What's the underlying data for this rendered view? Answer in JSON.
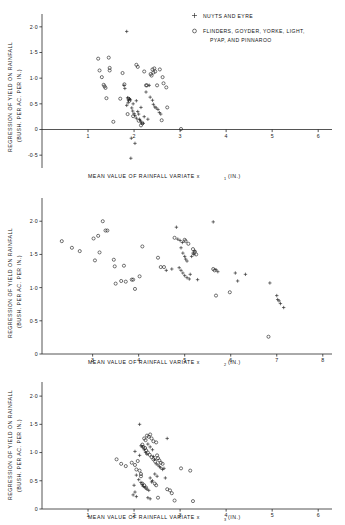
{
  "figure": {
    "title": "",
    "legend": {
      "position": "top-right",
      "entries": [
        {
          "marker": "plus",
          "label": "NUYTS AND EYRE"
        },
        {
          "marker": "circle",
          "label": "FLINDERS, GOYDER, YORKE, LIGHT,"
        },
        {
          "marker": "none",
          "label": "PYAP, AND PINNAROO"
        }
      ]
    },
    "shared_ylabel_line1": "REGRESSION OF YIELD ON RAINFALL",
    "shared_ylabel_line2": "(BUSH. PER AC. PER IN.)"
  },
  "chart_data": [
    {
      "type": "scatter",
      "title": "",
      "xlabel": "MEAN VALUE OF RAINFALL VARIATE x",
      "xlabel_sub": "1",
      "xlabel_unit": "(IN.)",
      "ylabel": "REGRESSION OF YIELD ON RAINFALL (BUSH. PER AC. PER IN.)",
      "xlim": [
        0,
        6.3
      ],
      "ylim": [
        -0.75,
        2.25
      ],
      "xticks": [
        1,
        2,
        3,
        4,
        5,
        6
      ],
      "xticklabels": [
        "1",
        "2",
        "3",
        "4",
        "5",
        "6"
      ],
      "yticks": [
        -0.5,
        0,
        0.5,
        1.0,
        1.5,
        2.0
      ],
      "yticklabels": [
        "-0·5",
        "0",
        "0·5",
        "1·0",
        "1·5",
        "2·0"
      ],
      "grid": false,
      "series": [
        {
          "name": "NUYTS AND EYRE",
          "marker": "plus",
          "points": [
            [
              1.84,
              1.91
            ],
            [
              1.78,
              0.86
            ],
            [
              1.8,
              0.8
            ],
            [
              1.86,
              0.62
            ],
            [
              1.88,
              0.57
            ],
            [
              1.9,
              0.6
            ],
            [
              1.92,
              0.58
            ],
            [
              1.87,
              0.52
            ],
            [
              1.84,
              0.47
            ],
            [
              1.95,
              0.42
            ],
            [
              1.97,
              0.36
            ],
            [
              2.0,
              0.31
            ],
            [
              2.02,
              0.27
            ],
            [
              2.05,
              0.22
            ],
            [
              2.08,
              0.35
            ],
            [
              2.1,
              0.3
            ],
            [
              2.12,
              0.2
            ],
            [
              2.14,
              0.17
            ],
            [
              2.16,
              0.13
            ],
            [
              2.2,
              0.12
            ],
            [
              2.22,
              0.25
            ],
            [
              2.26,
              0.73
            ],
            [
              2.35,
              0.63
            ],
            [
              2.4,
              0.57
            ],
            [
              2.42,
              0.49
            ],
            [
              2.45,
              0.44
            ],
            [
              2.48,
              0.42
            ],
            [
              2.52,
              0.39
            ],
            [
              2.55,
              0.33
            ],
            [
              2.58,
              0.3
            ],
            [
              1.94,
              -0.17
            ],
            [
              2.02,
              -0.27
            ],
            [
              1.93,
              -0.56
            ],
            [
              2.33,
              0.86
            ],
            [
              2.05,
              0.56
            ],
            [
              1.98,
              0.5
            ],
            [
              2.3,
              0.2
            ],
            [
              2.15,
              0.43
            ]
          ]
        },
        {
          "name": "FLINDERS, GOYDER, YORKE, LIGHT, PYAP, AND PINNAROO",
          "marker": "circle",
          "points": [
            [
              1.22,
              1.38
            ],
            [
              1.25,
              1.15
            ],
            [
              1.3,
              1.02
            ],
            [
              1.34,
              0.87
            ],
            [
              1.36,
              0.84
            ],
            [
              1.38,
              0.81
            ],
            [
              1.4,
              0.61
            ],
            [
              1.45,
              1.4
            ],
            [
              1.47,
              1.2
            ],
            [
              1.47,
              1.15
            ],
            [
              1.55,
              0.15
            ],
            [
              1.75,
              1.1
            ],
            [
              1.79,
              0.88
            ],
            [
              1.7,
              0.6
            ],
            [
              1.88,
              0.6
            ],
            [
              1.9,
              0.56
            ],
            [
              1.86,
              0.3
            ],
            [
              1.98,
              0.26
            ],
            [
              2.05,
              1.26
            ],
            [
              2.08,
              1.22
            ],
            [
              2.22,
              1.13
            ],
            [
              2.26,
              0.86
            ],
            [
              2.28,
              0.86
            ],
            [
              2.4,
              1.17
            ],
            [
              2.44,
              1.19
            ],
            [
              2.42,
              1.11
            ],
            [
              2.46,
              1.13
            ],
            [
              2.5,
              0.86
            ],
            [
              2.56,
              1.17
            ],
            [
              2.62,
              1.02
            ],
            [
              2.64,
              0.9
            ],
            [
              2.7,
              0.82
            ],
            [
              2.72,
              0.43
            ],
            [
              2.6,
              0.18
            ],
            [
              2.36,
              1.08
            ],
            [
              2.38,
              1.05
            ],
            [
              3.02,
              0.01
            ],
            [
              2.15,
              0.08
            ],
            [
              2.18,
              0.12
            ],
            [
              2.1,
              0.17
            ]
          ]
        }
      ]
    },
    {
      "type": "scatter",
      "title": "",
      "xlabel": "MEAN VALUE OF RAINFALL VARIATE x",
      "xlabel_sub": "2",
      "xlabel_unit": "(IN.)",
      "ylabel": "REGRESSION OF YIELD ON RAINFALL (BUSH. PER AC. PER IN.)",
      "xlim": [
        1.9,
        8.2
      ],
      "ylim": [
        0,
        2.35
      ],
      "xticks": [
        3,
        4,
        5,
        6,
        7,
        8
      ],
      "xticklabels": [
        "3",
        "4",
        "5",
        "6",
        "7",
        "8"
      ],
      "yticks": [
        0,
        0.5,
        1.0,
        1.5,
        2.0
      ],
      "yticklabels": [
        "0",
        "0·5",
        "1·0",
        "1·5",
        "2·0"
      ],
      "grid": false,
      "series": [
        {
          "name": "NUYTS AND EYRE",
          "marker": "plus",
          "points": [
            [
              4.85,
              1.73
            ],
            [
              4.9,
              1.71
            ],
            [
              4.95,
              1.68
            ],
            [
              4.92,
              1.6
            ],
            [
              4.96,
              1.52
            ],
            [
              5.0,
              1.47
            ],
            [
              5.02,
              1.43
            ],
            [
              5.05,
              1.4
            ],
            [
              4.88,
              1.3
            ],
            [
              4.92,
              1.26
            ],
            [
              4.96,
              1.22
            ],
            [
              5.0,
              1.18
            ],
            [
              5.05,
              1.15
            ],
            [
              5.1,
              1.13
            ],
            [
              5.15,
              1.47
            ],
            [
              5.18,
              1.52
            ],
            [
              5.2,
              1.5
            ],
            [
              5.22,
              1.55
            ],
            [
              5.28,
              1.12
            ],
            [
              4.82,
              1.91
            ],
            [
              5.62,
              1.99
            ],
            [
              5.68,
              1.27
            ],
            [
              5.72,
              1.24
            ],
            [
              6.1,
              1.22
            ],
            [
              6.15,
              1.1
            ],
            [
              6.32,
              1.2
            ],
            [
              6.85,
              1.07
            ],
            [
              7.0,
              0.88
            ],
            [
              7.02,
              0.82
            ],
            [
              7.05,
              0.8
            ],
            [
              7.08,
              0.76
            ],
            [
              7.15,
              0.7
            ],
            [
              4.6,
              1.26
            ],
            [
              4.72,
              1.28
            ],
            [
              5.12,
              1.2
            ]
          ]
        },
        {
          "name": "FLINDERS, GOYDER, YORKE, LIGHT, PYAP, AND PINNAROO",
          "marker": "circle",
          "points": [
            [
              2.33,
              1.7
            ],
            [
              2.55,
              1.6
            ],
            [
              2.72,
              1.55
            ],
            [
              3.02,
              1.74
            ],
            [
              3.05,
              1.41
            ],
            [
              3.12,
              1.78
            ],
            [
              3.15,
              1.53
            ],
            [
              3.22,
              2.0
            ],
            [
              3.28,
              1.86
            ],
            [
              3.46,
              1.42
            ],
            [
              3.48,
              1.32
            ],
            [
              3.5,
              1.06
            ],
            [
              3.62,
              1.1
            ],
            [
              3.68,
              1.33
            ],
            [
              3.72,
              1.09
            ],
            [
              3.85,
              1.12
            ],
            [
              3.88,
              1.12
            ],
            [
              3.92,
              0.98
            ],
            [
              4.02,
              1.17
            ],
            [
              4.08,
              1.62
            ],
            [
              4.42,
              1.45
            ],
            [
              4.55,
              1.31
            ],
            [
              4.78,
              1.75
            ],
            [
              5.0,
              1.72
            ],
            [
              5.02,
              1.7
            ],
            [
              5.18,
              1.58
            ],
            [
              5.22,
              1.54
            ],
            [
              5.25,
              1.5
            ],
            [
              5.62,
              1.28
            ],
            [
              5.65,
              1.26
            ],
            [
              5.68,
              0.88
            ],
            [
              5.98,
              0.93
            ],
            [
              6.82,
              0.26
            ],
            [
              4.48,
              1.31
            ],
            [
              5.08,
              1.66
            ],
            [
              3.32,
              1.86
            ]
          ]
        }
      ]
    },
    {
      "type": "scatter",
      "title": "",
      "xlabel": "MEAN VALUE OF RAINFALL VARIATE x",
      "xlabel_sub": "3",
      "xlabel_unit": "(IN.)",
      "ylabel": "REGRESSION OF YIELD ON RAINFALL (BUSH. PER AC. PER IN.)",
      "xlim": [
        0,
        6.3
      ],
      "ylim": [
        0,
        2.25
      ],
      "xticks": [
        1,
        2,
        3,
        4,
        5,
        6
      ],
      "xticklabels": [
        "1",
        "2",
        "3",
        "4",
        "5",
        "6"
      ],
      "yticks": [
        0,
        0.5,
        1.0,
        1.5,
        2.0
      ],
      "yticklabels": [
        "0",
        "0·5",
        "1·0",
        "1·5",
        "2·0"
      ],
      "grid": false,
      "series": [
        {
          "name": "NUYTS AND EYRE",
          "marker": "plus",
          "points": [
            [
              2.12,
              1.5
            ],
            [
              2.02,
              1.02
            ],
            [
              2.12,
              0.95
            ],
            [
              2.15,
              1.12
            ],
            [
              2.18,
              1.1
            ],
            [
              2.22,
              1.05
            ],
            [
              2.25,
              1.0
            ],
            [
              2.28,
              0.97
            ],
            [
              2.3,
              1.15
            ],
            [
              2.35,
              1.1
            ],
            [
              2.4,
              1.05
            ],
            [
              2.42,
              0.93
            ],
            [
              2.45,
              0.88
            ],
            [
              2.48,
              0.8
            ],
            [
              2.52,
              0.78
            ],
            [
              2.55,
              0.75
            ],
            [
              2.58,
              0.73
            ],
            [
              2.62,
              0.7
            ],
            [
              2.65,
              0.72
            ],
            [
              2.68,
              0.55
            ],
            [
              2.05,
              0.6
            ],
            [
              2.1,
              0.52
            ],
            [
              2.15,
              0.47
            ],
            [
              2.18,
              0.43
            ],
            [
              2.2,
              0.4
            ],
            [
              2.24,
              0.38
            ],
            [
              2.28,
              0.35
            ],
            [
              2.32,
              0.33
            ],
            [
              2.35,
              0.55
            ],
            [
              2.4,
              0.5
            ],
            [
              2.0,
              0.42
            ],
            [
              2.02,
              0.3
            ],
            [
              1.98,
              0.25
            ],
            [
              2.05,
              0.22
            ],
            [
              2.3,
              0.2
            ],
            [
              2.35,
              0.18
            ],
            [
              2.45,
              0.62
            ],
            [
              2.5,
              0.58
            ],
            [
              2.72,
              1.25
            ],
            [
              2.38,
              0.48
            ]
          ]
        },
        {
          "name": "FLINDERS, GOYDER, YORKE, LIGHT, PYAP, AND PINNAROO",
          "marker": "circle",
          "points": [
            [
              1.62,
              0.88
            ],
            [
              1.72,
              0.8
            ],
            [
              1.82,
              0.76
            ],
            [
              1.95,
              0.82
            ],
            [
              2.02,
              0.78
            ],
            [
              2.08,
              0.85
            ],
            [
              2.22,
              1.25
            ],
            [
              2.25,
              1.22
            ],
            [
              2.28,
              1.3
            ],
            [
              2.32,
              1.28
            ],
            [
              2.35,
              1.32
            ],
            [
              2.38,
              1.25
            ],
            [
              2.42,
              1.2
            ],
            [
              2.18,
              1.14
            ],
            [
              2.2,
              1.1
            ],
            [
              2.24,
              1.08
            ],
            [
              2.26,
              1.04
            ],
            [
              2.3,
              1.0
            ],
            [
              2.34,
              0.96
            ],
            [
              2.38,
              0.92
            ],
            [
              2.42,
              0.88
            ],
            [
              2.46,
              0.84
            ],
            [
              2.5,
              0.95
            ],
            [
              2.52,
              0.9
            ],
            [
              2.55,
              0.86
            ],
            [
              2.58,
              0.82
            ],
            [
              2.62,
              0.8
            ],
            [
              2.05,
              0.7
            ],
            [
              2.12,
              0.68
            ],
            [
              2.15,
              0.62
            ],
            [
              2.18,
              0.45
            ],
            [
              2.22,
              0.42
            ],
            [
              2.26,
              0.38
            ],
            [
              2.45,
              0.45
            ],
            [
              2.48,
              0.42
            ],
            [
              2.52,
              0.2
            ],
            [
              2.72,
              0.35
            ],
            [
              2.78,
              0.33
            ],
            [
              2.82,
              0.28
            ],
            [
              2.88,
              0.15
            ],
            [
              3.02,
              0.72
            ],
            [
              3.22,
              0.68
            ],
            [
              3.28,
              0.14
            ],
            [
              2.48,
              1.18
            ],
            [
              2.15,
              0.58
            ]
          ]
        }
      ]
    }
  ]
}
